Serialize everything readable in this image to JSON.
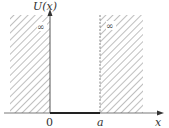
{
  "diagram": {
    "type": "infinite-square-well",
    "y_axis_label": "U(x)",
    "x_axis_label": "x",
    "origin_label": "0",
    "well_edge_label": "a",
    "left_barrier_label": "∞",
    "right_barrier_label": "∞",
    "colors": {
      "line": "#333333",
      "hatch": "#888888",
      "background": "#ffffff"
    }
  }
}
